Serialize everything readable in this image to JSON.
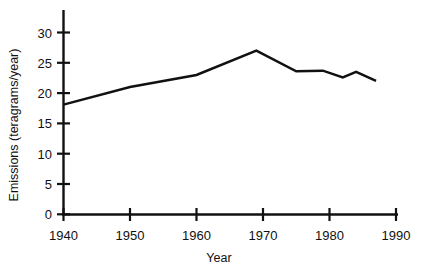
{
  "chart_data": {
    "type": "line",
    "title": "",
    "xlabel": "Year",
    "ylabel": "Emissions (teragrams/year)",
    "xlim": [
      1940,
      1990
    ],
    "ylim": [
      0,
      32
    ],
    "xticks": [
      1940,
      1950,
      1960,
      1970,
      1980,
      1990
    ],
    "xtick_labels": [
      "1940",
      "1950",
      "1960",
      "1970",
      "1980",
      "1990"
    ],
    "yticks": [
      0,
      5,
      10,
      15,
      20,
      25,
      30
    ],
    "ytick_labels": [
      "0",
      "5",
      "10",
      "15",
      "20",
      "25",
      "30"
    ],
    "grid": false,
    "legend": "none",
    "series": [
      {
        "name": "Emissions",
        "x": [
          1940,
          1950,
          1960,
          1969,
          1975,
          1979,
          1982,
          1984,
          1987
        ],
        "values": [
          18.1,
          21.0,
          23.0,
          27.0,
          23.6,
          23.7,
          22.6,
          23.5,
          22.0
        ]
      }
    ],
    "annotations": []
  },
  "axis": {
    "y_title": "Emissions (teragrams/year)",
    "x_title": "Year",
    "y_labels": [
      "30",
      "25",
      "20",
      "15",
      "10",
      "5",
      "0"
    ],
    "x_labels": [
      "1940",
      "1950",
      "1960",
      "1970",
      "1980",
      "1990"
    ]
  },
  "colors": {
    "line": "#111111",
    "axis": "#111111",
    "background": "#ffffff"
  }
}
